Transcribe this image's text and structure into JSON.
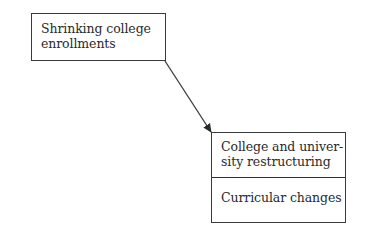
{
  "diagram": {
    "type": "flow",
    "nodes": [
      {
        "id": "shrinking-enrollments",
        "label": "Shrinking college enrollments",
        "lines": [
          "Shrinking college",
          "enrollments"
        ]
      },
      {
        "id": "restructuring-stack",
        "sections": [
          {
            "label": "College and university restructuring",
            "lines": [
              "College and univer-",
              "sity restructuring"
            ]
          },
          {
            "label": "Curricular changes",
            "lines": [
              "Curricular changes"
            ]
          }
        ]
      }
    ],
    "edges": [
      {
        "from": "shrinking-enrollments",
        "to": "restructuring-stack",
        "style": "arrow"
      }
    ],
    "colors": {
      "stroke": "#3a3a3a",
      "text": "#2a2a2a",
      "background": "#ffffff"
    }
  }
}
